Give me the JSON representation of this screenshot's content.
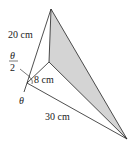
{
  "diagram": {
    "labels": {
      "edge_top": "20 cm",
      "edge_inner": "8 cm",
      "edge_bottom": "30 cm",
      "half_angle_num": "θ",
      "half_angle_den": "2",
      "angle": "θ"
    },
    "colors": {
      "stroke": "#222222",
      "shade": "#d4d4d4"
    }
  }
}
